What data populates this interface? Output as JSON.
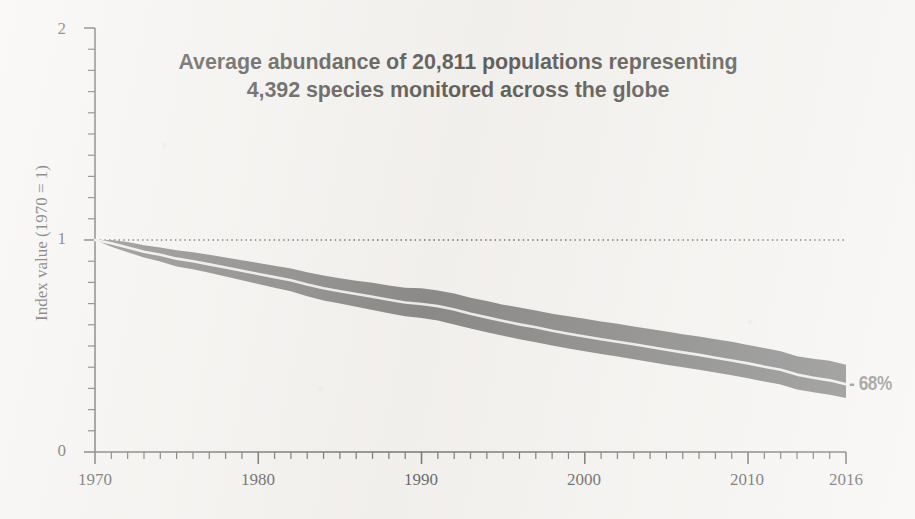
{
  "figure": {
    "background_color": "#f3f1ee",
    "width": 915,
    "height": 519
  },
  "chart_data": {
    "type": "line",
    "title": "Average abundance of 20,811 populations representing 4,392 species monitored across the globe",
    "title_lines": [
      "Average abundance of 20,811 populations representing",
      "4,392 species monitored across the globe"
    ],
    "xlabel": "",
    "ylabel": "Index value (1970 = 1)",
    "xlim": [
      1970,
      2016
    ],
    "ylim": [
      0,
      2
    ],
    "xticks": [
      1970,
      1980,
      1990,
      2000,
      2010,
      2016
    ],
    "xtick_labels": [
      "1970",
      "1980",
      "1990",
      "2000",
      "2010",
      "2016"
    ],
    "yticks": [
      0,
      1,
      2
    ],
    "ytick_labels": [
      "0",
      "1",
      "2"
    ],
    "y_minor_tick_step": 0.1,
    "x_minor_tick_step": 1,
    "grid": false,
    "legend": null,
    "reference_line": {
      "y": 1,
      "style": "dotted",
      "color": "#2b2b2b",
      "label": "1970 baseline"
    },
    "annotations": [
      {
        "text": "- 68%",
        "x": 2016,
        "y": 0.32,
        "color": "#5f5f5f"
      }
    ],
    "series": [
      {
        "name": "Global Living Planet Index (mean)",
        "color": "#e9e6e1",
        "x": [
          1970,
          1971,
          1972,
          1973,
          1974,
          1975,
          1976,
          1977,
          1978,
          1979,
          1980,
          1981,
          1982,
          1983,
          1984,
          1985,
          1986,
          1987,
          1988,
          1989,
          1990,
          1991,
          1992,
          1993,
          1994,
          1995,
          1996,
          1997,
          1998,
          1999,
          2000,
          2001,
          2002,
          2003,
          2004,
          2005,
          2006,
          2007,
          2008,
          2009,
          2010,
          2011,
          2012,
          2013,
          2014,
          2015,
          2016
        ],
        "values": [
          1.0,
          0.985,
          0.965,
          0.945,
          0.93,
          0.912,
          0.9,
          0.885,
          0.87,
          0.855,
          0.84,
          0.825,
          0.81,
          0.79,
          0.772,
          0.758,
          0.745,
          0.732,
          0.718,
          0.705,
          0.698,
          0.688,
          0.672,
          0.652,
          0.635,
          0.618,
          0.602,
          0.588,
          0.572,
          0.558,
          0.545,
          0.532,
          0.52,
          0.508,
          0.495,
          0.482,
          0.47,
          0.458,
          0.445,
          0.432,
          0.418,
          0.402,
          0.388,
          0.365,
          0.35,
          0.338,
          0.32
        ]
      },
      {
        "name": "Confidence interval upper",
        "color": "#555555",
        "x": [
          1970,
          1971,
          1972,
          1973,
          1974,
          1975,
          1976,
          1977,
          1978,
          1979,
          1980,
          1981,
          1982,
          1983,
          1984,
          1985,
          1986,
          1987,
          1988,
          1989,
          1990,
          1991,
          1992,
          1993,
          1994,
          1995,
          1996,
          1997,
          1998,
          1999,
          2000,
          2001,
          2002,
          2003,
          2004,
          2005,
          2006,
          2007,
          2008,
          2009,
          2010,
          2011,
          2012,
          2013,
          2014,
          2015,
          2016
        ],
        "values": [
          1.0,
          1.0,
          0.99,
          0.975,
          0.965,
          0.952,
          0.942,
          0.93,
          0.918,
          0.905,
          0.892,
          0.878,
          0.865,
          0.848,
          0.832,
          0.82,
          0.808,
          0.798,
          0.785,
          0.775,
          0.772,
          0.762,
          0.748,
          0.728,
          0.712,
          0.695,
          0.682,
          0.668,
          0.652,
          0.64,
          0.628,
          0.615,
          0.605,
          0.592,
          0.58,
          0.568,
          0.555,
          0.545,
          0.532,
          0.52,
          0.505,
          0.49,
          0.475,
          0.452,
          0.44,
          0.43,
          0.412
        ]
      },
      {
        "name": "Confidence interval lower",
        "color": "#555555",
        "x": [
          1970,
          1971,
          1972,
          1973,
          1974,
          1975,
          1976,
          1977,
          1978,
          1979,
          1980,
          1981,
          1982,
          1983,
          1984,
          1985,
          1986,
          1987,
          1988,
          1989,
          1990,
          1991,
          1992,
          1993,
          1994,
          1995,
          1996,
          1997,
          1998,
          1999,
          2000,
          2001,
          2002,
          2003,
          2004,
          2005,
          2006,
          2007,
          2008,
          2009,
          2010,
          2011,
          2012,
          2013,
          2014,
          2015,
          2016
        ],
        "values": [
          1.0,
          0.968,
          0.942,
          0.918,
          0.898,
          0.875,
          0.862,
          0.845,
          0.828,
          0.81,
          0.792,
          0.775,
          0.758,
          0.735,
          0.715,
          0.7,
          0.685,
          0.67,
          0.655,
          0.64,
          0.632,
          0.62,
          0.602,
          0.582,
          0.565,
          0.548,
          0.532,
          0.518,
          0.502,
          0.488,
          0.475,
          0.462,
          0.45,
          0.438,
          0.425,
          0.412,
          0.4,
          0.388,
          0.375,
          0.362,
          0.348,
          0.332,
          0.318,
          0.295,
          0.282,
          0.27,
          0.255
        ]
      }
    ],
    "band": {
      "fill_color": "#555555",
      "center_line_color": "#eeeae5"
    }
  },
  "axes": {
    "line_color": "#3a3a3a",
    "ytick_0": "0",
    "ytick_1": "1",
    "ytick_2": "2",
    "xtick_1970": "1970",
    "xtick_1980": "1980",
    "xtick_1990": "1990",
    "xtick_2000": "2000",
    "xtick_2010": "2010",
    "xtick_2016": "2016"
  },
  "annotation": {
    "percent_change": "- 68%"
  }
}
